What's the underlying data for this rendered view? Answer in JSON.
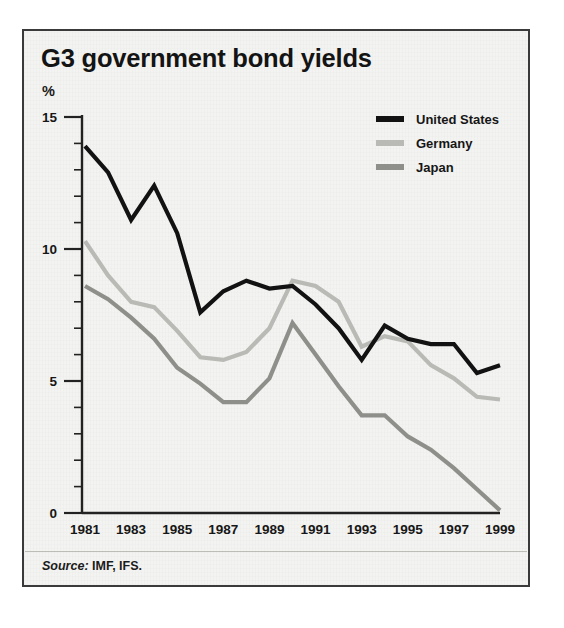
{
  "figure": {
    "title": "G3 government bond yields",
    "y_unit_label": "%",
    "source_keyword": "Source:",
    "source_text": " IMF, IFS."
  },
  "colors": {
    "united_states": "#121212",
    "germany": "#b9b9b6",
    "japan": "#8e8e8b",
    "axis": "#222222",
    "frame": "#3a3a3a",
    "background": "#f3f3f1"
  },
  "chart_data": {
    "type": "line",
    "title": "G3 government bond yields",
    "subtitle": "",
    "xlabel": "",
    "ylabel": "%",
    "ylim": [
      0,
      15
    ],
    "xlim": [
      1981,
      1999
    ],
    "yticks": [
      0,
      5,
      10,
      15
    ],
    "ytick_labels": [
      "0",
      "5",
      "10",
      "15"
    ],
    "yminor_step": 1,
    "xticks": [
      1981,
      1983,
      1985,
      1987,
      1989,
      1991,
      1993,
      1995,
      1997,
      1999
    ],
    "xtick_labels": [
      "1981",
      "1983",
      "1985",
      "1987",
      "1989",
      "1991",
      "1993",
      "1995",
      "1997",
      "1999"
    ],
    "grid": false,
    "legend_position": "top-right",
    "x": [
      1981,
      1982,
      1983,
      1984,
      1985,
      1986,
      1987,
      1988,
      1989,
      1990,
      1991,
      1992,
      1993,
      1994,
      1995,
      1996,
      1997,
      1998,
      1999
    ],
    "series": [
      {
        "name": "United States",
        "color": "#121212",
        "values": [
          13.9,
          12.9,
          11.1,
          12.4,
          10.6,
          7.6,
          8.4,
          8.8,
          8.5,
          8.6,
          7.9,
          7.0,
          5.8,
          7.1,
          6.6,
          6.4,
          6.4,
          5.3,
          5.6
        ]
      },
      {
        "name": "Germany",
        "color": "#b9b9b6",
        "values": [
          10.3,
          9.0,
          8.0,
          7.8,
          6.9,
          5.9,
          5.8,
          6.1,
          7.0,
          8.8,
          8.6,
          8.0,
          6.3,
          6.7,
          6.5,
          5.6,
          5.1,
          4.4,
          4.3
        ]
      },
      {
        "name": "Japan",
        "color": "#8e8e8b",
        "values": [
          8.6,
          8.1,
          7.4,
          6.6,
          5.5,
          4.9,
          4.2,
          4.2,
          5.1,
          7.2,
          6.0,
          4.8,
          3.7,
          3.7,
          2.9,
          2.4,
          1.7,
          0.9,
          0.1
        ]
      }
    ]
  }
}
